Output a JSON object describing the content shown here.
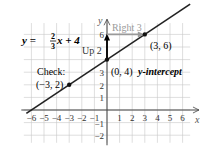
{
  "chart_data": {
    "type": "line",
    "title": "",
    "equation": {
      "lhs": "y",
      "eq": " = ",
      "num": "2",
      "den": "3",
      "rest": "x + 4"
    },
    "xlabel": "x",
    "ylabel": "y",
    "xlim": [
      -7,
      7
    ],
    "ylim": [
      -3,
      7
    ],
    "grid": true,
    "x_ticks": [
      -6,
      -5,
      -4,
      -3,
      -2,
      -1,
      1,
      2,
      3,
      4,
      5,
      6
    ],
    "x_tick_labels": [
      "−6",
      "−5",
      "−4",
      "−3",
      "−2",
      "−1",
      "1",
      "2",
      "3",
      "4",
      "5",
      "6"
    ],
    "y_ticks": [
      6,
      3,
      2,
      1,
      -1,
      -2
    ],
    "y_tick_labels": [
      "6",
      "3",
      "2",
      "1",
      "−1",
      "−2"
    ],
    "line": {
      "slope": 0.6667,
      "intercept": 4,
      "x_range": [
        -6.4,
        6.0
      ]
    },
    "points": [
      {
        "x": 0,
        "y": 4,
        "label": "(0, 4)",
        "note": "y-intercept"
      },
      {
        "x": 3,
        "y": 6,
        "label": "(3, 6)"
      },
      {
        "x": -3,
        "y": 2,
        "label": "(−3, 2)",
        "note": "Check:"
      }
    ],
    "annotations": {
      "up": "Up 2",
      "right": "Right 3"
    },
    "colors": {
      "grid": "#c8c8c8",
      "axis": "#444444",
      "line": "#222222",
      "arrow_gray": "#9a9a9a"
    }
  }
}
